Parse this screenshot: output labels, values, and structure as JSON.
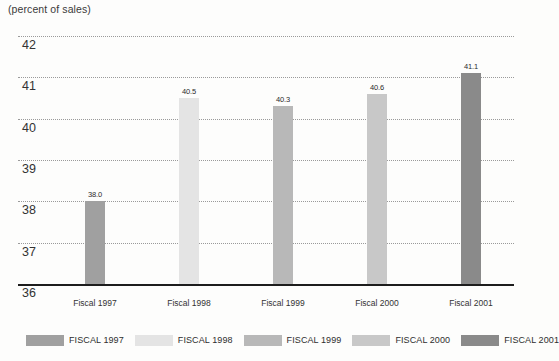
{
  "chart_data": {
    "type": "bar",
    "title": "(percent of sales)",
    "xlabel": "",
    "ylabel": "",
    "categories": [
      "Fiscal 1997",
      "Fiscal 1998",
      "Fiscal 1999",
      "Fiscal 2000",
      "Fiscal 2001"
    ],
    "values": [
      38.0,
      40.5,
      40.3,
      40.6,
      41.1
    ],
    "value_labels": [
      "38.0",
      "40.5",
      "40.3",
      "40.6",
      "41.1"
    ],
    "ylim": [
      36,
      42.4
    ],
    "yticks": [
      "42",
      "41",
      "40",
      "39",
      "38",
      "37"
    ],
    "ytick_values": [
      42,
      41,
      40,
      39,
      38,
      37
    ],
    "axis_base_label": "36",
    "grid": true,
    "grid_style": "dotted",
    "legend_position": "bottom",
    "legend": [
      {
        "label": "FISCAL 1997",
        "color": "#a0a0a0"
      },
      {
        "label": "FISCAL 1998",
        "color": "#e4e4e4"
      },
      {
        "label": "FISCAL 1999",
        "color": "#b8b8b8"
      },
      {
        "label": "FISCAL 2000",
        "color": "#c8c8c8"
      },
      {
        "label": "FISCAL 2001",
        "color": "#8a8a8a"
      }
    ],
    "bar_colors": [
      "#a0a0a0",
      "#e4e4e4",
      "#b8b8b8",
      "#c8c8c8",
      "#8a8a8a"
    ]
  }
}
